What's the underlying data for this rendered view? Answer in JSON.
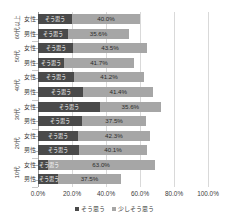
{
  "chart_data": {
    "type": "bar",
    "orientation": "horizontal",
    "stacked": true,
    "title": "",
    "xlabel": "",
    "ylabel": "",
    "xlim": [
      0,
      100
    ],
    "grid": true,
    "legend_position": "bottom",
    "categories": [
      "60代以上 女性",
      "60代以上 男性",
      "50代 女性",
      "50代 男性",
      "40代 女性",
      "40代 男性",
      "30代 女性",
      "30代 男性",
      "20代 女性",
      "20代 男性",
      "10代 女性",
      "10代 男性"
    ],
    "groups": [
      {
        "label": "60代以上",
        "rows": [
          "女性",
          "男性"
        ]
      },
      {
        "label": "50代",
        "rows": [
          "女性",
          "男性"
        ]
      },
      {
        "label": "40代",
        "rows": [
          "女性",
          "男性"
        ]
      },
      {
        "label": "30代",
        "rows": [
          "女性",
          "男性"
        ]
      },
      {
        "label": "20代",
        "rows": [
          "女性",
          "男性"
        ]
      },
      {
        "label": "10代",
        "rows": [
          "女性",
          "男性"
        ]
      }
    ],
    "series": [
      {
        "name": "そう思う",
        "color": "#4a4a4a",
        "values": [
          20.0,
          17.8,
          20.6,
          15.0,
          21.2,
          26.5,
          36.5,
          26.0,
          23.5,
          24.1,
          5.6,
          11.5
        ]
      },
      {
        "name": "少しそう思う",
        "color": "#a6a6a6",
        "values": [
          40.0,
          35.6,
          43.5,
          41.7,
          41.2,
          41.4,
          35.6,
          37.5,
          42.3,
          40.1,
          63.0,
          37.5
        ]
      }
    ],
    "value_labels": [
      "40.0%",
      "35.6%",
      "43.5%",
      "41.7%",
      "41.2%",
      "41.4%",
      "35.6%",
      "37.5%",
      "42.3%",
      "40.1%",
      "63.0%",
      "37.5%"
    ],
    "xticks": [
      "0.0%",
      "20.0%",
      "40.0%",
      "60.0%",
      "80.0%",
      "100.0%"
    ],
    "xtick_values": [
      0,
      20,
      40,
      60,
      80,
      100
    ]
  },
  "legend": {
    "items": [
      {
        "label": "そう思う",
        "color": "#4a4a4a"
      },
      {
        "label": "少しそう思う",
        "color": "#a6a6a6"
      }
    ]
  }
}
